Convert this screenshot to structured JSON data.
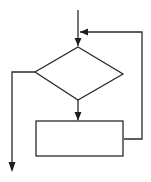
{
  "diagram": {
    "type": "flowchart",
    "nodes": [
      {
        "id": "decision",
        "shape": "diamond",
        "label": ""
      },
      {
        "id": "process",
        "shape": "rectangle",
        "label": ""
      }
    ],
    "edges": [
      {
        "from": "entry",
        "to": "decision",
        "label": ""
      },
      {
        "from": "decision",
        "to": "process",
        "label": ""
      },
      {
        "from": "process",
        "to": "entry-loop",
        "label": ""
      },
      {
        "from": "decision",
        "to": "exit",
        "label": ""
      }
    ],
    "colors": {
      "stroke": "#2a2a2a",
      "background": "#ffffff"
    }
  }
}
